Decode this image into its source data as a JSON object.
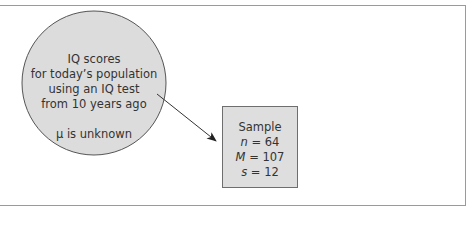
{
  "population": {
    "lines": [
      "IQ scores",
      "for today’s population",
      "using an IQ test",
      "from 10 years ago"
    ],
    "mu_line": "μ is unknown"
  },
  "sample": {
    "title": "Sample",
    "n_symbol": "n",
    "n_value": "= 64",
    "M_symbol": "M",
    "M_value": "= 107",
    "s_symbol": "s",
    "s_value": "= 12"
  },
  "colors": {
    "circle_fill": "#dcdcdc",
    "box_fill": "#dedede",
    "stroke": "#555555",
    "frame": "#9a9a9a"
  }
}
